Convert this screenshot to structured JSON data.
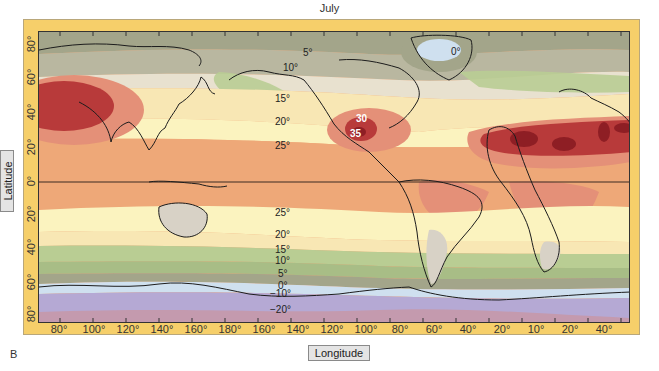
{
  "title": "July",
  "panel_label": "B",
  "axes": {
    "y_label": "Latitude",
    "x_label": "Longitude",
    "lat_ticks": [
      "80°",
      "60°",
      "40°",
      "20°",
      "0°",
      "20°",
      "40°",
      "60°",
      "80°"
    ],
    "lon_ticks": [
      "80°",
      "100°",
      "120°",
      "140°",
      "160°",
      "180°",
      "160°",
      "140°",
      "120°",
      "100°",
      "80°",
      "60°",
      "40°",
      "20°",
      "10°",
      "20°",
      "40°"
    ]
  },
  "isotherms": [
    {
      "id": "iso-5-north",
      "text": "5°"
    },
    {
      "id": "iso-10-north",
      "text": "10°"
    },
    {
      "id": "iso-15-north",
      "text": "15°"
    },
    {
      "id": "iso-20-north",
      "text": "20°"
    },
    {
      "id": "iso-25-north",
      "text": "25°"
    },
    {
      "id": "iso-30-mexico",
      "text": "30"
    },
    {
      "id": "iso-35-mexico",
      "text": "35"
    },
    {
      "id": "iso-0-greenland",
      "text": "0°"
    },
    {
      "id": "iso-25-south",
      "text": "25°"
    },
    {
      "id": "iso-20-south",
      "text": "20°"
    },
    {
      "id": "iso-15-south",
      "text": "15°"
    },
    {
      "id": "iso-10-south",
      "text": "10°"
    },
    {
      "id": "iso-5-south",
      "text": "5°"
    },
    {
      "id": "iso-0-south",
      "text": "0°"
    },
    {
      "id": "iso-minus10-south",
      "text": "−10°"
    },
    {
      "id": "iso-minus20-south",
      "text": "−20°"
    }
  ],
  "colors": {
    "frame": "#f6cf6a",
    "t_gt35": "#8e1e24",
    "t_30_35": "#b83a3a",
    "t_25_30": "#e49078",
    "t_20_25": "#eea878",
    "t_15_20": "#f8e7b4",
    "t_10_15": "#fbf3bf",
    "t_5_10": "#b9cd93",
    "t_0_5": "#a3a58a",
    "t_minus": "#cfe0ef",
    "t_minus10": "#b5a9d4",
    "t_minus20": "#c49aae",
    "land_cool": "#d8d2c6"
  }
}
